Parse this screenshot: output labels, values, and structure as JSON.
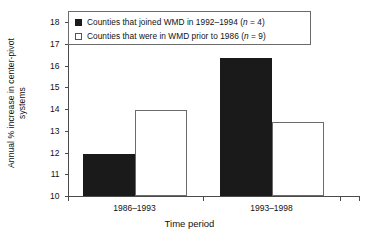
{
  "chart_data": {
    "type": "bar",
    "title": "",
    "subtitle": "",
    "xlabel": "Time period",
    "ylabel": "Annual % increase in center-pivot systems",
    "ylabel_line1": "Annual % increase in center-pivot",
    "ylabel_line2": "systems",
    "categories": [
      "1986–1993",
      "1993–1998"
    ],
    "ylim": [
      10,
      18
    ],
    "ytick_labels": [
      "10",
      "11",
      "12",
      "13",
      "14",
      "15",
      "16",
      "17",
      "18"
    ],
    "yticks": [
      10,
      11,
      12,
      13,
      14,
      15,
      16,
      17,
      18
    ],
    "grid": false,
    "legend_position": "top",
    "series": [
      {
        "name": "Counties that joined WMD in 1992–1994 (n = 4)",
        "label_main": "Counties that joined WMD in 1992–1994 (",
        "label_italic": "n",
        "label_tail": " = 4)",
        "style": "filled",
        "color": "#1a1a1a",
        "values": [
          11.95,
          16.35
        ]
      },
      {
        "name": "Counties that were in WMD prior to 1986 (n = 9)",
        "label_main": "Counties that were in WMD prior to 1986 (",
        "label_italic": "n",
        "label_tail": " = 9)",
        "style": "open",
        "color": "#ffffff",
        "edge_color": "#6b6b6b",
        "values": [
          13.95,
          13.4
        ]
      }
    ]
  }
}
